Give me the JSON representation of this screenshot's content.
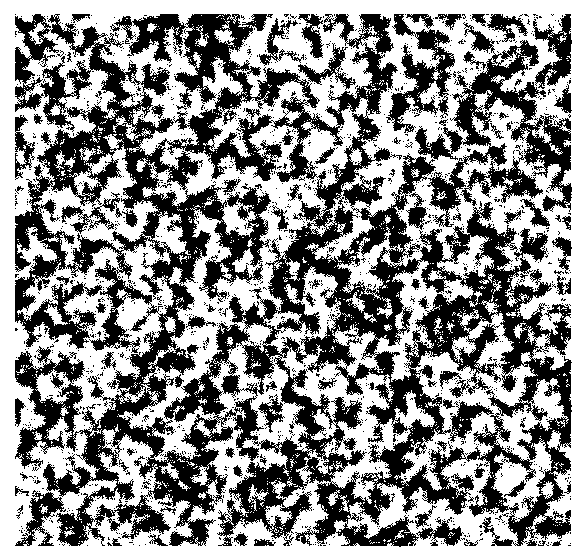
{
  "image": {
    "kind": "random-dot noise texture",
    "width": 585,
    "height": 558,
    "background_color": "#ffffff",
    "ink_color": "#000000",
    "texture_region": {
      "x": 15,
      "y": 14,
      "width": 557,
      "height": 534
    },
    "density": 0.5,
    "features": {
      "arcs": [
        {
          "cx": 95,
          "cy": 300,
          "r": 90
        },
        {
          "cx": 250,
          "cy": 300,
          "r": 90
        },
        {
          "cx": 400,
          "cy": 300,
          "r": 90
        },
        {
          "cx": 520,
          "cy": 300,
          "r": 80
        }
      ],
      "vertical_streaks": [
        {
          "x": 393,
          "y1": 230,
          "y2": 330
        },
        {
          "x": 503,
          "y1": 230,
          "y2": 320
        },
        {
          "x": 300,
          "y1": 230,
          "y2": 320
        }
      ]
    }
  }
}
